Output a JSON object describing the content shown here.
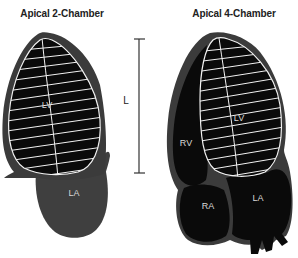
{
  "diagrams": [
    {
      "title": "Apical 2-Chamber",
      "labels": {
        "lv": "LV",
        "la": "LA"
      }
    },
    {
      "title": "Apical 4-Chamber",
      "labels": {
        "lv": "LV",
        "rv": "RV",
        "ra": "RA",
        "la": "LA"
      }
    }
  ],
  "measurement": {
    "label": "L"
  },
  "colors": {
    "wall": "#3b3b3b",
    "cavity": "#0a0a0a",
    "grid": "#f2f2f2",
    "atrium_2ch": "#3f3f3f",
    "text_dark": "#222222",
    "text_light": "#d8d8d8"
  }
}
